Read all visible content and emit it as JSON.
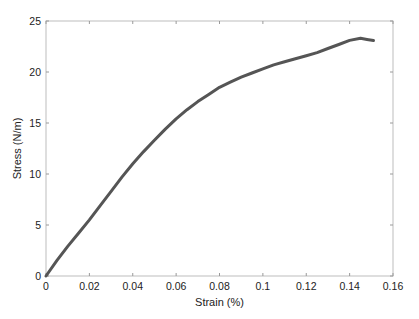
{
  "chart_data": {
    "type": "line",
    "title": "",
    "xlabel": "Strain (%)",
    "ylabel": "Stress (N/m)",
    "xlim": [
      0,
      0.16
    ],
    "ylim": [
      0,
      25
    ],
    "xticks": [
      0,
      0.02,
      0.04,
      0.06,
      0.08,
      0.1,
      0.12,
      0.14,
      0.16
    ],
    "xtick_labels": [
      "0",
      "0.02",
      "0.04",
      "0.06",
      "0.08",
      "0.1",
      "0.12",
      "0.14",
      "0.16"
    ],
    "yticks": [
      0,
      5,
      10,
      15,
      20,
      25
    ],
    "ytick_labels": [
      "0",
      "5",
      "10",
      "15",
      "20",
      "25"
    ],
    "grid": false,
    "legend": null,
    "series": [
      {
        "name": "Stress-strain",
        "color": "#555555",
        "x": [
          0,
          0.005,
          0.01,
          0.015,
          0.02,
          0.025,
          0.03,
          0.035,
          0.04,
          0.045,
          0.05,
          0.055,
          0.06,
          0.065,
          0.07,
          0.075,
          0.08,
          0.085,
          0.09,
          0.095,
          0.1,
          0.105,
          0.11,
          0.115,
          0.12,
          0.125,
          0.13,
          0.135,
          0.14,
          0.145,
          0.148,
          0.151
        ],
        "y": [
          0,
          1.5,
          2.9,
          4.2,
          5.5,
          6.9,
          8.3,
          9.7,
          11.0,
          12.2,
          13.3,
          14.4,
          15.4,
          16.3,
          17.1,
          17.8,
          18.5,
          19.0,
          19.5,
          19.9,
          20.3,
          20.7,
          21.0,
          21.3,
          21.6,
          21.9,
          22.3,
          22.7,
          23.1,
          23.3,
          23.2,
          23.1
        ]
      }
    ]
  }
}
